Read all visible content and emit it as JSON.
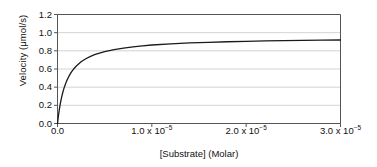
{
  "chart_data": {
    "type": "line",
    "title": "",
    "subtitle": "",
    "xlabel": "[Substrate] (Molar)",
    "ylabel": "Velocity (μmol/s)",
    "xlim": [
      0,
      3e-05
    ],
    "ylim": [
      0.0,
      1.2
    ],
    "grid": "horizontal",
    "legend": "none",
    "xticks": [
      0,
      1e-05,
      2e-05,
      3e-05
    ],
    "xtick_labels": [
      "0.0",
      "1.0 x 10⁻⁵",
      "2.0 x 10⁻⁵",
      "3.0 x 10⁻⁵"
    ],
    "xtick_labels_parts": [
      {
        "mantissa": "0.0",
        "exponent": ""
      },
      {
        "mantissa": "1.0 x 10",
        "exponent": "−5"
      },
      {
        "mantissa": "2.0 x 10",
        "exponent": "−5"
      },
      {
        "mantissa": "3.0 x 10",
        "exponent": "−5"
      }
    ],
    "yticks": [
      0.0,
      0.2,
      0.4,
      0.6,
      0.8,
      1.0,
      1.2
    ],
    "ytick_labels": [
      "0.0",
      "0.2",
      "0.4",
      "0.6",
      "0.8",
      "1.0",
      "1.2"
    ],
    "model": "michaelis-menten",
    "vmax": 0.95,
    "km": 1e-06,
    "line_color": "#1a1a1a",
    "grid_color": "#c8c8c8",
    "axis_color": "#555555",
    "series": [
      {
        "name": "velocity",
        "x": [
          0.0,
          5e-08,
          1e-07,
          2e-07,
          3e-07,
          4e-07,
          5e-07,
          6e-07,
          7e-07,
          8e-07,
          9e-07,
          1e-06,
          1.2e-06,
          1.4e-06,
          1.6e-06,
          1.8e-06,
          2e-06,
          2.5e-06,
          3e-06,
          3.5e-06,
          4e-06,
          5e-06,
          6e-06,
          7e-06,
          8e-06,
          9e-06,
          1e-05,
          1.2e-05,
          1.4e-05,
          1.6e-05,
          1.8e-05,
          2e-05,
          2.2e-05,
          2.4e-05,
          2.6e-05,
          2.8e-05,
          3e-05
        ],
        "y": [
          0.0,
          0.045,
          0.086,
          0.158,
          0.219,
          0.271,
          0.317,
          0.356,
          0.392,
          0.422,
          0.45,
          0.475,
          0.518,
          0.554,
          0.585,
          0.611,
          0.633,
          0.679,
          0.713,
          0.739,
          0.76,
          0.792,
          0.814,
          0.831,
          0.844,
          0.855,
          0.864,
          0.877,
          0.887,
          0.894,
          0.9,
          0.905,
          0.909,
          0.912,
          0.915,
          0.917,
          0.919
        ]
      }
    ]
  }
}
